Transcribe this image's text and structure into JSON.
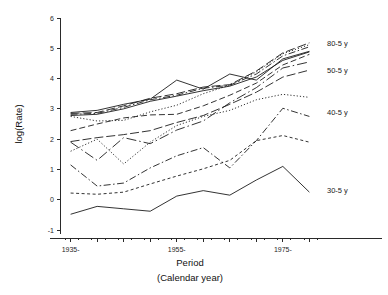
{
  "chart_data": {
    "type": "line",
    "title": "",
    "xlabel": "Period",
    "xlabel_sub": "(Calendar year)",
    "ylabel": "log(Rate)",
    "xlim": [
      1933,
      1982
    ],
    "ylim": [
      -1,
      6
    ],
    "grid": false,
    "legend_position": "right-inline",
    "x_tick_labels": [
      "1935-",
      "1955-",
      "1975-"
    ],
    "x_tick_values": [
      1935,
      1955,
      1975
    ],
    "x_minor_tick_values": [
      1935,
      1940,
      1945,
      1950,
      1955,
      1960,
      1965,
      1970,
      1975,
      1980
    ],
    "y_tick_labels": [
      "-1",
      "0",
      "1",
      "2",
      "3",
      "4",
      "5",
      "6"
    ],
    "y_tick_values": [
      -1,
      0,
      1,
      2,
      3,
      4,
      5,
      6
    ],
    "x": [
      1935,
      1940,
      1945,
      1950,
      1955,
      1960,
      1965,
      1970,
      1975,
      1980
    ],
    "series": [
      {
        "name": "80-5 y",
        "label": "80-5 y",
        "dash": "none",
        "label_y": 5.15,
        "values": [
          2.88,
          2.95,
          3.15,
          3.32,
          3.95,
          3.65,
          4.15,
          3.95,
          4.65,
          4.9
        ]
      },
      {
        "name": "75-5 y",
        "label": "",
        "dash": "long-dash",
        "label_y": null,
        "values": [
          2.85,
          2.88,
          3.1,
          3.35,
          3.5,
          3.72,
          3.8,
          4.25,
          4.85,
          5.18
        ]
      },
      {
        "name": "70-5 y",
        "label": "",
        "dash": "dash-dot",
        "label_y": null,
        "values": [
          2.82,
          2.85,
          3.05,
          3.3,
          3.45,
          3.68,
          3.78,
          4.15,
          4.75,
          5.05
        ]
      },
      {
        "name": "65-5 y",
        "label": "",
        "dash": "solid-thin",
        "label_y": null,
        "values": [
          2.78,
          2.82,
          3.0,
          3.25,
          3.42,
          3.6,
          3.75,
          4.05,
          4.6,
          4.88
        ]
      },
      {
        "name": "60-5 y",
        "label": "",
        "dash": "fine-dot",
        "label_y": null,
        "values": [
          2.75,
          2.6,
          2.62,
          2.9,
          3.12,
          3.5,
          3.78,
          4.22,
          4.82,
          5.12
        ]
      },
      {
        "name": "55-5 y",
        "label": "",
        "dash": "medium-dash",
        "label_y": null,
        "values": [
          2.28,
          2.5,
          2.7,
          2.8,
          2.82,
          3.1,
          3.45,
          3.85,
          4.45,
          4.8
        ]
      },
      {
        "name": "50-5 y",
        "label": "50-5 y",
        "dash": "long-dash",
        "label_y": 4.28,
        "values": [
          1.92,
          2.05,
          2.15,
          2.28,
          2.55,
          2.78,
          3.15,
          3.55,
          4.05,
          4.28
        ]
      },
      {
        "name": "45-5 y",
        "label": "",
        "dash": "dash-dot-long",
        "label_y": null,
        "values": [
          1.9,
          1.3,
          2.05,
          1.85,
          2.3,
          2.6,
          3.2,
          3.7,
          4.35,
          4.55
        ]
      },
      {
        "name": "42-5 y",
        "label": "",
        "dash": "fine-dot",
        "label_y": null,
        "values": [
          1.6,
          2.0,
          1.18,
          1.9,
          2.45,
          2.75,
          2.95,
          3.3,
          3.48,
          3.38
        ]
      },
      {
        "name": "40-5 y",
        "label": "40-5 y",
        "dash": "dash-dot",
        "label_y": 2.88,
        "values": [
          1.15,
          0.45,
          0.55,
          1.05,
          1.45,
          1.72,
          1.05,
          1.95,
          3.02,
          2.75
        ]
      },
      {
        "name": "35-5 y",
        "label": "",
        "dash": "short-dash",
        "label_y": null,
        "values": [
          0.22,
          0.18,
          0.25,
          0.52,
          0.78,
          1.02,
          1.3,
          1.95,
          2.12,
          1.9
        ]
      },
      {
        "name": "30-5 y",
        "label": "30-5 y",
        "dash": "none",
        "label_y": 0.32,
        "values": [
          -0.48,
          -0.22,
          -0.3,
          -0.38,
          0.12,
          0.3,
          0.15,
          0.65,
          1.1,
          0.25
        ]
      }
    ]
  },
  "layout": {
    "plot_left": 60,
    "plot_right": 320,
    "plot_top": 18,
    "plot_bottom": 230,
    "label_x": 327
  }
}
